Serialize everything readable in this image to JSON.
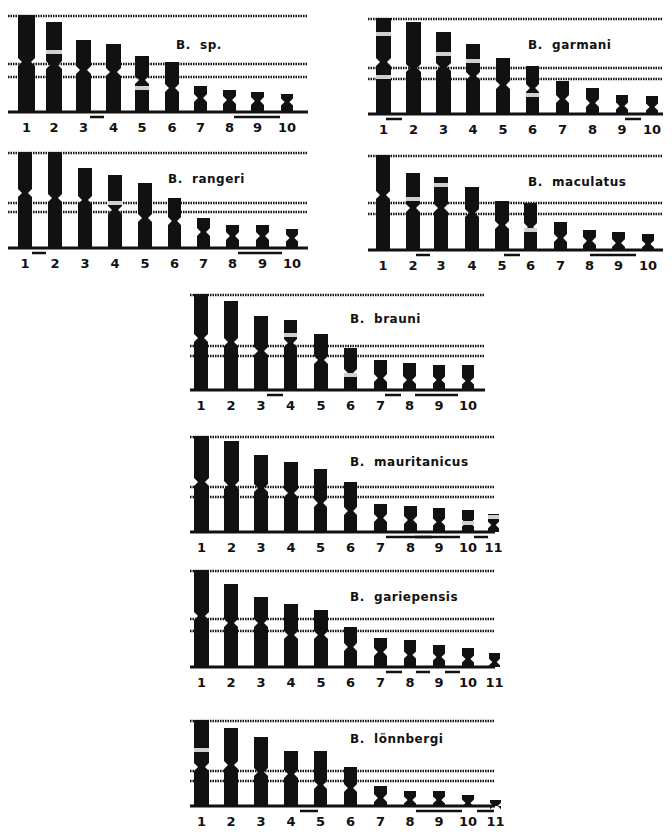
{
  "figure": {
    "colors": {
      "ink": "#111111",
      "band": "#cfcfcf",
      "background": "#ffffff"
    },
    "panels": [
      {
        "id": "b-sp",
        "species": "B.  sp.",
        "x": 8,
        "y": 10,
        "w": 305,
        "h": 128,
        "label_pos": [
          168,
          28
        ],
        "baseline": 102,
        "ref_lines": [
          5,
          53,
          66
        ],
        "chromosomes": [
          {
            "num": "1",
            "x": 10,
            "top": 5,
            "cen": 52,
            "w": 17,
            "band": null
          },
          {
            "num": "2",
            "x": 38,
            "top": 12,
            "cen": 55,
            "w": 16,
            "band": 42
          },
          {
            "num": "3",
            "x": 68,
            "top": 30,
            "cen": 60,
            "w": 15,
            "band": null
          },
          {
            "num": "4",
            "x": 98,
            "top": 34,
            "cen": 62,
            "w": 15,
            "band": null
          },
          {
            "num": "5",
            "x": 127,
            "top": 46,
            "cen": 70,
            "w": 14,
            "band": 78
          },
          {
            "num": "6",
            "x": 157,
            "top": 52,
            "cen": 78,
            "w": 14,
            "band": null
          },
          {
            "num": "7",
            "x": 186,
            "top": 76,
            "cen": 88,
            "w": 13,
            "band": null
          },
          {
            "num": "8",
            "x": 215,
            "top": 80,
            "cen": 90,
            "w": 13,
            "band": null
          },
          {
            "num": "9",
            "x": 243,
            "top": 82,
            "cen": 91,
            "w": 13,
            "band": null
          },
          {
            "num": "10",
            "x": 273,
            "top": 84,
            "cen": 92,
            "w": 12,
            "band": null
          }
        ],
        "pair_bars": [
          [
            82,
            96
          ],
          [
            226,
            272
          ]
        ]
      },
      {
        "id": "b-garmani",
        "species": "B.  garmani",
        "x": 368,
        "y": 10,
        "w": 300,
        "h": 128,
        "label_pos": [
          160,
          28
        ],
        "baseline": 104,
        "ref_lines": [
          8,
          57,
          68
        ],
        "chromosomes": [
          {
            "num": "1",
            "x": 8,
            "top": 8,
            "cen": 52,
            "w": 15,
            "band": 24,
            "band2": 67
          },
          {
            "num": "2",
            "x": 38,
            "top": 12,
            "cen": 58,
            "w": 15,
            "band": null
          },
          {
            "num": "3",
            "x": 68,
            "top": 22,
            "cen": 57,
            "w": 15,
            "band": 44
          },
          {
            "num": "4",
            "x": 98,
            "top": 34,
            "cen": 66,
            "w": 14,
            "band": 51
          },
          {
            "num": "5",
            "x": 128,
            "top": 48,
            "cen": 75,
            "w": 14,
            "band": null
          },
          {
            "num": "6",
            "x": 158,
            "top": 56,
            "cen": 78,
            "w": 13,
            "band": 85
          },
          {
            "num": "7",
            "x": 188,
            "top": 71,
            "cen": 89,
            "w": 13,
            "band": null
          },
          {
            "num": "8",
            "x": 218,
            "top": 78,
            "cen": 93,
            "w": 13,
            "band": null
          },
          {
            "num": "9",
            "x": 248,
            "top": 85,
            "cen": 96,
            "w": 12,
            "band": null
          },
          {
            "num": "10",
            "x": 278,
            "top": 86,
            "cen": 97,
            "w": 12,
            "band": null
          }
        ],
        "pair_bars": [
          [
            18,
            34
          ],
          [
            257,
            273
          ]
        ]
      },
      {
        "id": "b-rangeri",
        "species": "B.  rangeri",
        "x": 8,
        "y": 150,
        "w": 305,
        "h": 115,
        "label_pos": [
          160,
          22
        ],
        "baseline": 98,
        "ref_lines": [
          2,
          52,
          61
        ],
        "chromosomes": [
          {
            "num": "1",
            "x": 10,
            "top": 2,
            "cen": 43,
            "w": 14,
            "band": null
          },
          {
            "num": "2",
            "x": 40,
            "top": 2,
            "cen": 48,
            "w": 14,
            "band": null
          },
          {
            "num": "3",
            "x": 70,
            "top": 18,
            "cen": 50,
            "w": 14,
            "band": null
          },
          {
            "num": "4",
            "x": 100,
            "top": 25,
            "cen": 60,
            "w": 14,
            "band": 53
          },
          {
            "num": "5",
            "x": 130,
            "top": 33,
            "cen": 68,
            "w": 14,
            "band": null
          },
          {
            "num": "6",
            "x": 160,
            "top": 48,
            "cen": 71,
            "w": 13,
            "band": null
          },
          {
            "num": "7",
            "x": 189,
            "top": 68,
            "cen": 82,
            "w": 13,
            "band": null
          },
          {
            "num": "8",
            "x": 218,
            "top": 75,
            "cen": 86,
            "w": 13,
            "band": null
          },
          {
            "num": "9",
            "x": 248,
            "top": 75,
            "cen": 86,
            "w": 13,
            "band": null
          },
          {
            "num": "10",
            "x": 278,
            "top": 79,
            "cen": 88,
            "w": 12,
            "band": null
          }
        ],
        "pair_bars": [
          [
            24,
            38
          ],
          [
            230,
            274
          ]
        ]
      },
      {
        "id": "b-maculatus",
        "species": "B.  maculatus",
        "x": 368,
        "y": 150,
        "w": 300,
        "h": 130,
        "label_pos": [
          160,
          25
        ],
        "baseline": 100,
        "ref_lines": [
          5,
          52,
          63
        ],
        "chromosomes": [
          {
            "num": "1",
            "x": 8,
            "top": 5,
            "cen": 45,
            "w": 14,
            "band": null
          },
          {
            "num": "2",
            "x": 38,
            "top": 23,
            "cen": 58,
            "w": 14,
            "band": 49
          },
          {
            "num": "3",
            "x": 66,
            "top": 27,
            "cen": 58,
            "w": 14,
            "band": 35
          },
          {
            "num": "4",
            "x": 97,
            "top": 37,
            "cen": 63,
            "w": 14,
            "band": null
          },
          {
            "num": "5",
            "x": 127,
            "top": 51,
            "cen": 75,
            "w": 14,
            "band": null
          },
          {
            "num": "6",
            "x": 156,
            "top": 53,
            "cen": 77,
            "w": 13,
            "band": 80
          },
          {
            "num": "7",
            "x": 186,
            "top": 72,
            "cen": 88,
            "w": 13,
            "band": null
          },
          {
            "num": "8",
            "x": 215,
            "top": 80,
            "cen": 91,
            "w": 13,
            "band": null
          },
          {
            "num": "9",
            "x": 244,
            "top": 82,
            "cen": 93,
            "w": 13,
            "band": null
          },
          {
            "num": "10",
            "x": 274,
            "top": 84,
            "cen": 94,
            "w": 12,
            "band": null
          }
        ],
        "pair_bars": [
          [
            48,
            62
          ],
          [
            136,
            152
          ],
          [
            222,
            268
          ]
        ]
      },
      {
        "id": "b-brauni",
        "species": "B.  brauni",
        "x": 190,
        "y": 290,
        "w": 300,
        "h": 130,
        "label_pos": [
          160,
          22
        ],
        "baseline": 100,
        "ref_lines": [
          4,
          55,
          65
        ],
        "chromosomes": [
          {
            "num": "1",
            "x": 4,
            "top": 4,
            "cen": 48,
            "w": 14,
            "band": null
          },
          {
            "num": "2",
            "x": 34,
            "top": 11,
            "cen": 52,
            "w": 14,
            "band": null
          },
          {
            "num": "3",
            "x": 64,
            "top": 26,
            "cen": 61,
            "w": 14,
            "band": null
          },
          {
            "num": "4",
            "x": 94,
            "top": 30,
            "cen": 53,
            "w": 13,
            "band": 45
          },
          {
            "num": "5",
            "x": 124,
            "top": 44,
            "cen": 70,
            "w": 14,
            "band": null
          },
          {
            "num": "6",
            "x": 154,
            "top": 58,
            "cen": 83,
            "w": 13,
            "band": 85
          },
          {
            "num": "7",
            "x": 184,
            "top": 70,
            "cen": 88,
            "w": 13,
            "band": null
          },
          {
            "num": "8",
            "x": 213,
            "top": 73,
            "cen": 90,
            "w": 13,
            "band": null
          },
          {
            "num": "9",
            "x": 243,
            "top": 75,
            "cen": 90,
            "w": 12,
            "band": null
          },
          {
            "num": "10",
            "x": 272,
            "top": 75,
            "cen": 91,
            "w": 12,
            "band": null
          }
        ],
        "pair_bars": [
          [
            77,
            93
          ],
          [
            195,
            211
          ],
          [
            225,
            268
          ]
        ]
      },
      {
        "id": "b-mauritanicus",
        "species": "B.  mauritanicus",
        "x": 190,
        "y": 430,
        "w": 310,
        "h": 130,
        "label_pos": [
          160,
          25
        ],
        "baseline": 102,
        "ref_lines": [
          6,
          56,
          66
        ],
        "chromosomes": [
          {
            "num": "1",
            "x": 4,
            "top": 6,
            "cen": 52,
            "w": 15,
            "band": null
          },
          {
            "num": "2",
            "x": 34,
            "top": 11,
            "cen": 55,
            "w": 15,
            "band": null
          },
          {
            "num": "3",
            "x": 64,
            "top": 25,
            "cen": 58,
            "w": 14,
            "band": null
          },
          {
            "num": "4",
            "x": 94,
            "top": 32,
            "cen": 63,
            "w": 14,
            "band": null
          },
          {
            "num": "5",
            "x": 124,
            "top": 39,
            "cen": 73,
            "w": 13,
            "band": null
          },
          {
            "num": "6",
            "x": 154,
            "top": 52,
            "cen": 81,
            "w": 13,
            "band": null
          },
          {
            "num": "7",
            "x": 184,
            "top": 74,
            "cen": 88,
            "w": 13,
            "band": null
          },
          {
            "num": "8",
            "x": 214,
            "top": 76,
            "cen": 90,
            "w": 13,
            "band": null
          },
          {
            "num": "9",
            "x": 243,
            "top": 78,
            "cen": 92,
            "w": 12,
            "band": null
          },
          {
            "num": "10",
            "x": 272,
            "top": 80,
            "cen": 93,
            "w": 12,
            "band": 93
          },
          {
            "num": "11",
            "x": 298,
            "top": 84,
            "cen": 95,
            "w": 11,
            "band": 87
          }
        ],
        "pair_bars": [
          [
            196,
            242
          ],
          [
            225,
            270
          ],
          [
            284,
            298
          ]
        ]
      },
      {
        "id": "b-gariepensis",
        "species": "B.  gariepensis",
        "x": 190,
        "y": 570,
        "w": 310,
        "h": 125,
        "label_pos": [
          160,
          20
        ],
        "baseline": 97,
        "ref_lines": [
          0,
          48,
          60
        ],
        "chromosomes": [
          {
            "num": "1",
            "x": 4,
            "top": 0,
            "cen": 46,
            "w": 15,
            "band": null
          },
          {
            "num": "2",
            "x": 34,
            "top": 14,
            "cen": 53,
            "w": 14,
            "band": null
          },
          {
            "num": "3",
            "x": 64,
            "top": 27,
            "cen": 53,
            "w": 14,
            "band": null
          },
          {
            "num": "4",
            "x": 94,
            "top": 34,
            "cen": 65,
            "w": 14,
            "band": null
          },
          {
            "num": "5",
            "x": 124,
            "top": 40,
            "cen": 65,
            "w": 14,
            "band": null
          },
          {
            "num": "6",
            "x": 154,
            "top": 57,
            "cen": 77,
            "w": 13,
            "band": null
          },
          {
            "num": "7",
            "x": 184,
            "top": 68,
            "cen": 82,
            "w": 13,
            "band": null
          },
          {
            "num": "8",
            "x": 214,
            "top": 70,
            "cen": 85,
            "w": 12,
            "band": null
          },
          {
            "num": "9",
            "x": 243,
            "top": 75,
            "cen": 87,
            "w": 12,
            "band": null
          },
          {
            "num": "10",
            "x": 272,
            "top": 78,
            "cen": 89,
            "w": 12,
            "band": null
          },
          {
            "num": "11",
            "x": 299,
            "top": 83,
            "cen": 92,
            "w": 11,
            "band": null
          }
        ],
        "pair_bars": [
          [
            196,
            212
          ],
          [
            226,
            240
          ],
          [
            255,
            270
          ]
        ]
      },
      {
        "id": "b-lonnbergi",
        "species": "B.  lönnbergi",
        "x": 190,
        "y": 710,
        "w": 310,
        "h": 126,
        "label_pos": [
          160,
          22
        ],
        "baseline": 96,
        "ref_lines": [
          10,
          60,
          70
        ],
        "chromosomes": [
          {
            "num": "1",
            "x": 4,
            "top": 10,
            "cen": 57,
            "w": 15,
            "band": 40
          },
          {
            "num": "2",
            "x": 34,
            "top": 18,
            "cen": 55,
            "w": 14,
            "band": null
          },
          {
            "num": "3",
            "x": 64,
            "top": 27,
            "cen": 62,
            "w": 14,
            "band": null
          },
          {
            "num": "4",
            "x": 94,
            "top": 41,
            "cen": 64,
            "w": 14,
            "band": null
          },
          {
            "num": "5",
            "x": 124,
            "top": 41,
            "cen": 75,
            "w": 13,
            "band": null
          },
          {
            "num": "6",
            "x": 154,
            "top": 57,
            "cen": 78,
            "w": 13,
            "band": null
          },
          {
            "num": "7",
            "x": 184,
            "top": 76,
            "cen": 88,
            "w": 13,
            "band": null
          },
          {
            "num": "8",
            "x": 214,
            "top": 81,
            "cen": 90,
            "w": 12,
            "band": null
          },
          {
            "num": "9",
            "x": 243,
            "top": 81,
            "cen": 90,
            "w": 12,
            "band": null
          },
          {
            "num": "10",
            "x": 272,
            "top": 85,
            "cen": 93,
            "w": 12,
            "band": null
          },
          {
            "num": "11",
            "x": 300,
            "top": 90,
            "cen": 96,
            "w": 11,
            "band": null
          }
        ],
        "pair_bars": [
          [
            110,
            128
          ],
          [
            226,
            272
          ],
          [
            287,
            304
          ]
        ]
      }
    ]
  }
}
